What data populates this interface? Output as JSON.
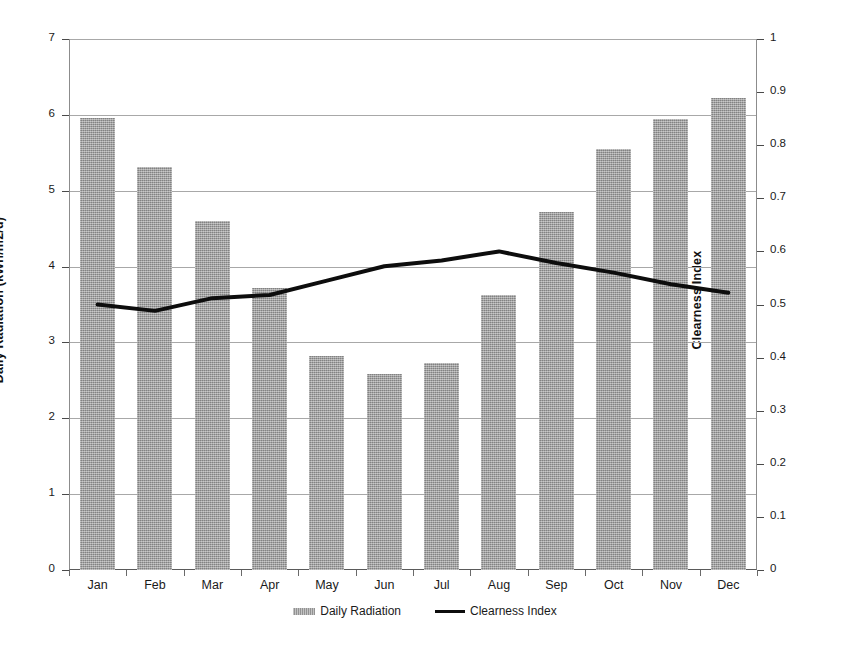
{
  "chart_data": {
    "type": "bar",
    "title": "",
    "subtitle": "",
    "xlabel": "",
    "ylabel": "Daily Radiation (kWh/m2/d)",
    "y2label": "Clearness Index",
    "categories": [
      "Jan",
      "Feb",
      "Mar",
      "Apr",
      "May",
      "Jun",
      "Jul",
      "Aug",
      "Sep",
      "Oct",
      "Nov",
      "Dec"
    ],
    "ylim": [
      0,
      7
    ],
    "y2lim": [
      0,
      1
    ],
    "yticks": [
      "0",
      "1",
      "2",
      "3",
      "4",
      "5",
      "6",
      "7"
    ],
    "ytick_values": [
      0,
      1,
      2,
      3,
      4,
      5,
      6,
      7
    ],
    "y2ticks": [
      "0",
      "0.1",
      "0.2",
      "0.3",
      "0.4",
      "0.5",
      "0.6",
      "0.7",
      "0.8",
      "0.9",
      "1"
    ],
    "y2tick_values": [
      0,
      0.1,
      0.2,
      0.3,
      0.4,
      0.5,
      0.6,
      0.7,
      0.8,
      0.9,
      1
    ],
    "grid": true,
    "legend_position": "bottom",
    "series": [
      {
        "name": "Daily Radiation",
        "type": "bar",
        "axis": "left",
        "color": "#9d9d9d",
        "values": [
          5.96,
          5.31,
          4.6,
          3.72,
          2.82,
          2.58,
          2.73,
          3.63,
          4.72,
          5.55,
          5.95,
          6.22
        ]
      },
      {
        "name": "Clearness Index",
        "type": "line",
        "axis": "right",
        "color": "#0d0d0d",
        "values": [
          0.5,
          0.488,
          0.512,
          0.518,
          0.545,
          0.572,
          0.583,
          0.6,
          0.578,
          0.56,
          0.538,
          0.522
        ]
      }
    ]
  },
  "legend": {
    "items": [
      {
        "label": "Daily Radiation",
        "marker": "bar-swatch"
      },
      {
        "label": "Clearness Index",
        "marker": "line-swatch"
      }
    ]
  }
}
